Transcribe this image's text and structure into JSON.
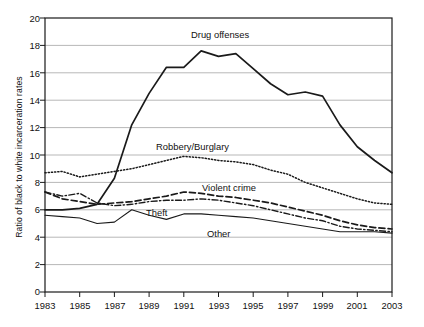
{
  "chart_data": {
    "type": "line",
    "title": "",
    "xlabel": "",
    "ylabel": "Ratio of black to white incarceration rates",
    "xlim": [
      1983,
      2003
    ],
    "ylim": [
      0,
      20
    ],
    "grid": true,
    "legend_position": "inline-annotations",
    "x": [
      1983,
      1984,
      1985,
      1986,
      1987,
      1988,
      1989,
      1990,
      1991,
      1992,
      1993,
      1994,
      1995,
      1996,
      1997,
      1998,
      1999,
      2000,
      2001,
      2002,
      2003
    ],
    "y_ticks": [
      0,
      2,
      4,
      6,
      8,
      10,
      12,
      14,
      16,
      18,
      20
    ],
    "x_ticks": [
      1983,
      1985,
      1987,
      1989,
      1991,
      1993,
      1995,
      1997,
      1999,
      2001,
      2003
    ],
    "series": [
      {
        "name": "Drug offenses",
        "style": "solid-thick",
        "label": "Drug offenses",
        "values": [
          6.0,
          6.0,
          6.1,
          6.4,
          8.3,
          12.2,
          14.5,
          16.4,
          16.4,
          17.6,
          17.2,
          17.4,
          16.3,
          15.2,
          14.4,
          14.6,
          14.3,
          12.2,
          10.6,
          9.6,
          8.7
        ]
      },
      {
        "name": "Robbery/Burglary",
        "style": "dotted",
        "label": "Robbery/Burglary",
        "values": [
          8.7,
          8.8,
          8.4,
          8.6,
          8.8,
          9.0,
          9.3,
          9.6,
          9.9,
          9.8,
          9.6,
          9.5,
          9.3,
          8.9,
          8.6,
          8.0,
          7.6,
          7.2,
          6.8,
          6.5,
          6.4
        ]
      },
      {
        "name": "Violent crime",
        "style": "dashed",
        "label": "Violent crime",
        "values": [
          7.3,
          6.8,
          6.6,
          6.4,
          6.5,
          6.6,
          6.8,
          7.0,
          7.3,
          7.2,
          7.0,
          6.9,
          6.7,
          6.5,
          6.2,
          5.9,
          5.6,
          5.2,
          4.9,
          4.7,
          4.6
        ]
      },
      {
        "name": "Theft",
        "style": "dash-dot",
        "label": "Theft",
        "values": [
          7.3,
          7.0,
          7.2,
          6.5,
          6.3,
          6.4,
          6.6,
          6.7,
          6.7,
          6.8,
          6.7,
          6.5,
          6.3,
          6.0,
          5.7,
          5.4,
          5.2,
          4.8,
          4.6,
          4.5,
          4.4
        ]
      },
      {
        "name": "Other",
        "style": "solid-thin",
        "label": "Other",
        "values": [
          5.6,
          5.5,
          5.4,
          5.0,
          5.1,
          6.0,
          5.6,
          5.3,
          5.7,
          5.7,
          5.6,
          5.5,
          5.4,
          5.2,
          5.0,
          4.8,
          4.6,
          4.4,
          4.4,
          4.4,
          4.3
        ]
      }
    ],
    "annotations": [
      {
        "text": "Drug offenses",
        "x_px": 191,
        "y_px": 29
      },
      {
        "text": "Robbery/Burglary",
        "x_px": 156,
        "y_px": 141
      },
      {
        "text": "Violent crime",
        "x_px": 202,
        "y_px": 182
      },
      {
        "text": "Theft",
        "x_px": 146,
        "y_px": 207
      },
      {
        "text": "Other",
        "x_px": 207,
        "y_px": 228
      }
    ]
  }
}
